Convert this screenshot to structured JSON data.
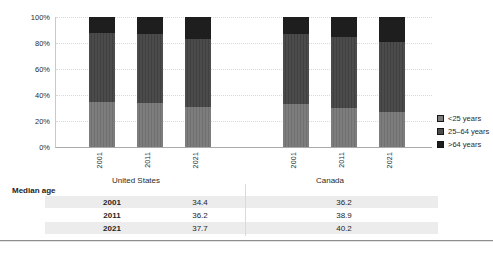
{
  "chart_data": {
    "type": "bar",
    "subtype": "100-percent-stacked-column",
    "title": "",
    "xlabel": "",
    "ylabel": "",
    "ylim": [
      0,
      100
    ],
    "yticks": [
      "0%",
      "20%",
      "40%",
      "60%",
      "80%",
      "100%"
    ],
    "grid": "horizontal-dotted",
    "legend_position": "right",
    "groups": [
      "United States",
      "Canada"
    ],
    "categories": [
      "2001",
      "2011",
      "2021"
    ],
    "series": [
      {
        "name": "<25 years",
        "color": "#7d7d7d",
        "stripe": "#707070",
        "values": {
          "United States": [
            35,
            34,
            31
          ],
          "Canada": [
            33,
            30,
            27
          ]
        }
      },
      {
        "name": "25–64 years",
        "color": "#4b4b4b",
        "stripe": "#404040",
        "values": {
          "United States": [
            53,
            53,
            52
          ],
          "Canada": [
            54,
            55,
            54
          ]
        }
      },
      {
        "name": ">64 years",
        "color": "#1e1e1e",
        "stripe": "#1e1e1e",
        "values": {
          "United States": [
            12,
            13,
            17
          ],
          "Canada": [
            13,
            15,
            19
          ]
        }
      }
    ]
  },
  "table": {
    "header": "Median age",
    "columns": [
      "United States",
      "Canada"
    ],
    "rows": [
      {
        "year": "2001",
        "values": [
          "34.4",
          "36.2"
        ]
      },
      {
        "year": "2011",
        "values": [
          "36.2",
          "38.9"
        ]
      },
      {
        "year": "2021",
        "values": [
          "37.7",
          "40.2"
        ]
      }
    ]
  },
  "colors": {
    "grid": "#d9d9d9",
    "axis": "#a9a9a9",
    "row_band": "#ececec",
    "text": "#2b2b2b"
  }
}
